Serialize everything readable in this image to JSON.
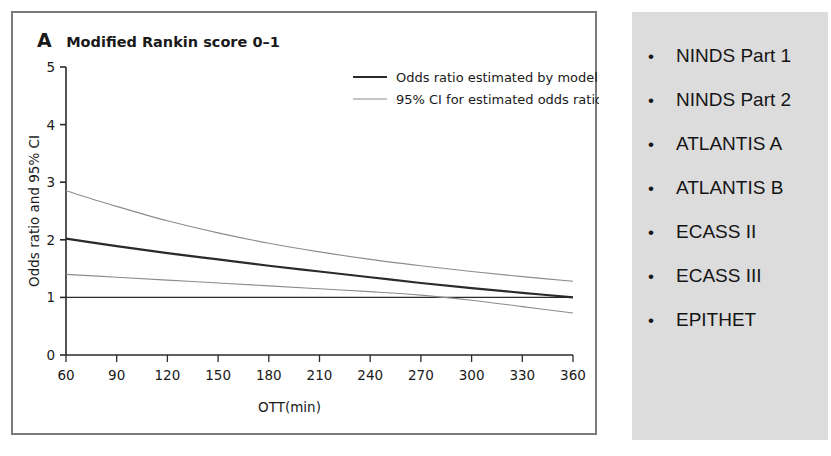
{
  "figure": {
    "panel_letter": "A",
    "panel_heading": "Modified Rankin score 0–1"
  },
  "chart_data": {
    "type": "line",
    "title": "Modified Rankin score 0–1",
    "xlabel": "OTT(min)",
    "ylabel": "Odds ratio and 95% CI",
    "xlim": [
      60,
      360
    ],
    "ylim": [
      0,
      5
    ],
    "xticks": [
      60,
      90,
      120,
      150,
      180,
      210,
      240,
      270,
      300,
      330,
      360
    ],
    "yticks": [
      0,
      1,
      2,
      3,
      4,
      5
    ],
    "xtick_labels": [
      "60",
      "90",
      "120",
      "150",
      "180",
      "210",
      "240",
      "270",
      "300",
      "330",
      "360"
    ],
    "ytick_labels": [
      "0",
      "1",
      "2",
      "3",
      "4",
      "5"
    ],
    "grid": false,
    "legend_position": "top-right",
    "reference_line": {
      "y": 1,
      "label": "no effect"
    },
    "x": [
      60,
      90,
      120,
      150,
      180,
      210,
      240,
      270,
      300,
      330,
      360
    ],
    "series": [
      {
        "name": "Odds ratio estimated by model",
        "color": "#2a2a2a",
        "values": [
          2.02,
          1.89,
          1.77,
          1.66,
          1.55,
          1.45,
          1.35,
          1.25,
          1.16,
          1.08,
          1.0
        ]
      },
      {
        "name": "95% CI for estimated odds ratio",
        "color": "#8c8c8c",
        "bound": "upper",
        "values": [
          2.85,
          2.58,
          2.33,
          2.12,
          1.94,
          1.79,
          1.66,
          1.55,
          1.45,
          1.36,
          1.28
        ]
      },
      {
        "name": "95% CI for estimated odds ratio",
        "color": "#8c8c8c",
        "bound": "lower",
        "values": [
          1.4,
          1.35,
          1.3,
          1.25,
          1.2,
          1.15,
          1.1,
          1.04,
          0.95,
          0.84,
          0.73
        ]
      }
    ],
    "legend": [
      {
        "label": "Odds ratio estimated by model",
        "color": "#2a2a2a"
      },
      {
        "label": "95% CI for estimated odds ratio",
        "color": "#8c8c8c"
      }
    ]
  },
  "trials": {
    "items": [
      {
        "label": "NINDS Part 1"
      },
      {
        "label": "NINDS Part 2"
      },
      {
        "label": "ATLANTIS A"
      },
      {
        "label": "ATLANTIS B"
      },
      {
        "label": "ECASS II"
      },
      {
        "label": "ECASS III"
      },
      {
        "label": "EPITHET"
      }
    ],
    "bullet": "•"
  },
  "colors": {
    "panel_background": "#dcdcdc",
    "border": "#7a7a7a",
    "model_line": "#2a2a2a",
    "ci_line": "#8c8c8c",
    "text": "#1a1a1a"
  }
}
